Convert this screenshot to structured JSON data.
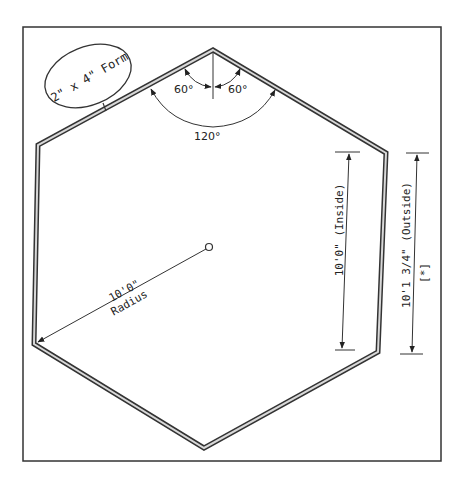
{
  "diagram": {
    "colors": {
      "line": "#333333",
      "form_fill": "#d8d8d8",
      "background": "#ffffff"
    },
    "callout": {
      "label": "2\" x 4\" Form"
    },
    "angles": {
      "left_half": "60°",
      "right_half": "60°",
      "interior": "120°"
    },
    "radius": {
      "value": "10'0\"",
      "label": "Radius"
    },
    "inside_dim": {
      "label": "10'0\" (Inside)"
    },
    "outside_dim": {
      "label": "10'1 3/4\" (Outside)",
      "note": "[*]"
    }
  }
}
